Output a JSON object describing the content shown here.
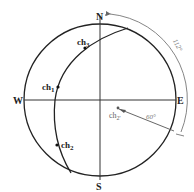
{
  "diagram": {
    "type": "stereonet",
    "directions": {
      "north": "N",
      "south": "S",
      "west": "W",
      "east": "E"
    },
    "points": [
      {
        "id": "ch3",
        "label": "ch",
        "sub": "3"
      },
      {
        "id": "ch1",
        "label": "ch",
        "sub": "1"
      },
      {
        "id": "ch2",
        "label": "ch",
        "sub": "2"
      },
      {
        "id": "ch2prime",
        "label": "ch",
        "sub": "2'"
      }
    ],
    "angles": {
      "strike_arc": "112°",
      "plunge": "60°"
    },
    "colors": {
      "line": "#222222",
      "annotation": "#777777"
    }
  }
}
